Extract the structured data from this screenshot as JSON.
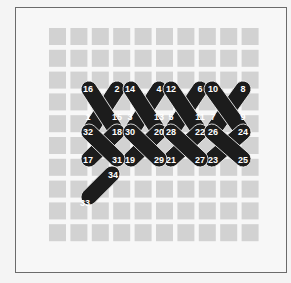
{
  "diagram": {
    "type": "cross-stitch-sequence",
    "grid": {
      "cols": 10,
      "rows": 10,
      "x0": 49,
      "y0": 28,
      "pitch_x": 21.4,
      "pitch_y": 21.8,
      "square": 17,
      "color": "#d2d2d2"
    },
    "stitch_color": "#1c1c1c",
    "label_color": "#ffffff",
    "stitches": [
      {
        "from": "1",
        "to": "2",
        "a": [
          89,
          132
        ],
        "b": [
          117,
          89
        ]
      },
      {
        "from": "3",
        "to": "4",
        "a": [
          131,
          132
        ],
        "b": [
          159,
          89
        ]
      },
      {
        "from": "5",
        "to": "6",
        "a": [
          171,
          132
        ],
        "b": [
          200,
          89
        ]
      },
      {
        "from": "7",
        "to": "8",
        "a": [
          212,
          132
        ],
        "b": [
          243,
          89
        ]
      },
      {
        "from": "10",
        "to": "9",
        "a": [
          212,
          89
        ],
        "b": [
          243,
          132
        ]
      },
      {
        "from": "12",
        "to": "11",
        "a": [
          171,
          89
        ],
        "b": [
          200,
          132
        ]
      },
      {
        "from": "14",
        "to": "13",
        "a": [
          131,
          89
        ],
        "b": [
          159,
          132
        ]
      },
      {
        "from": "16",
        "to": "15",
        "a": [
          89,
          89
        ],
        "b": [
          117,
          132
        ]
      },
      {
        "from": "17",
        "to": "18",
        "a": [
          89,
          159
        ],
        "b": [
          117,
          132
        ]
      },
      {
        "from": "19",
        "to": "20",
        "a": [
          131,
          159
        ],
        "b": [
          159,
          132
        ]
      },
      {
        "from": "21",
        "to": "22",
        "a": [
          171,
          159
        ],
        "b": [
          200,
          132
        ]
      },
      {
        "from": "23",
        "to": "24",
        "a": [
          212,
          159
        ],
        "b": [
          243,
          132
        ]
      },
      {
        "from": "26",
        "to": "25",
        "a": [
          212,
          132
        ],
        "b": [
          243,
          159
        ]
      },
      {
        "from": "28",
        "to": "27",
        "a": [
          171,
          132
        ],
        "b": [
          200,
          159
        ]
      },
      {
        "from": "30",
        "to": "29",
        "a": [
          131,
          132
        ],
        "b": [
          159,
          159
        ]
      },
      {
        "from": "32",
        "to": "31",
        "a": [
          89,
          132
        ],
        "b": [
          117,
          159
        ]
      },
      {
        "from": "33",
        "to": "34",
        "a": [
          89,
          197
        ],
        "b": [
          112,
          174
        ]
      }
    ],
    "labels": [
      {
        "text": "16",
        "x": 88,
        "y": 89
      },
      {
        "text": "2",
        "x": 117,
        "y": 89
      },
      {
        "text": "14",
        "x": 130,
        "y": 89
      },
      {
        "text": "4",
        "x": 159,
        "y": 89
      },
      {
        "text": "12",
        "x": 171,
        "y": 89
      },
      {
        "text": "6",
        "x": 200,
        "y": 89
      },
      {
        "text": "10",
        "x": 213,
        "y": 89
      },
      {
        "text": "8",
        "x": 243,
        "y": 89
      },
      {
        "text": "1",
        "x": 88,
        "y": 117
      },
      {
        "text": "15",
        "x": 117,
        "y": 117
      },
      {
        "text": "3",
        "x": 130,
        "y": 117
      },
      {
        "text": "13",
        "x": 159,
        "y": 117
      },
      {
        "text": "5",
        "x": 171,
        "y": 117
      },
      {
        "text": "11",
        "x": 200,
        "y": 117
      },
      {
        "text": "7",
        "x": 213,
        "y": 117
      },
      {
        "text": "9",
        "x": 243,
        "y": 117
      },
      {
        "text": "32",
        "x": 88,
        "y": 132
      },
      {
        "text": "18",
        "x": 117,
        "y": 132
      },
      {
        "text": "30",
        "x": 130,
        "y": 132
      },
      {
        "text": "20",
        "x": 159,
        "y": 132
      },
      {
        "text": "28",
        "x": 171,
        "y": 132
      },
      {
        "text": "22",
        "x": 200,
        "y": 132
      },
      {
        "text": "26",
        "x": 213,
        "y": 132
      },
      {
        "text": "24",
        "x": 243,
        "y": 132
      },
      {
        "text": "17",
        "x": 88,
        "y": 160
      },
      {
        "text": "31",
        "x": 117,
        "y": 160
      },
      {
        "text": "19",
        "x": 130,
        "y": 160
      },
      {
        "text": "29",
        "x": 159,
        "y": 160
      },
      {
        "text": "21",
        "x": 171,
        "y": 160
      },
      {
        "text": "27",
        "x": 200,
        "y": 160
      },
      {
        "text": "23",
        "x": 213,
        "y": 160
      },
      {
        "text": "25",
        "x": 243,
        "y": 160
      },
      {
        "text": "34",
        "x": 113,
        "y": 175
      },
      {
        "text": "33",
        "x": 85,
        "y": 203
      }
    ]
  }
}
